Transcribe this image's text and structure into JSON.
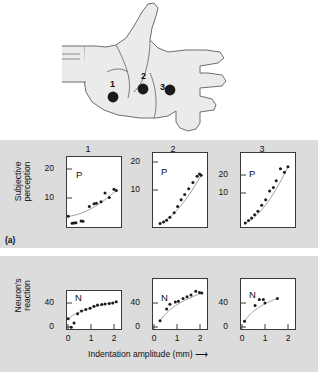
{
  "figure": {
    "panel_a_tag": "(a)",
    "x_axis_title": "Indentation amplitude (mm)",
    "x_axis_arrow": "⟶",
    "top_ylabel_line1": "Subjective",
    "top_ylabel_line2": "perception",
    "bottom_ylabel_line1": "Neuron's",
    "bottom_ylabel_line2": "reaction",
    "column_numbers": [
      "1",
      "2",
      "3"
    ],
    "hand_sites": [
      {
        "label": "1",
        "x": 37,
        "y": 31
      },
      {
        "label": "2",
        "x": 57,
        "y": 24
      },
      {
        "label": "3",
        "x": 74,
        "y": 28
      }
    ],
    "colors": {
      "panel_background": "#dcdcdc",
      "plot_background": "#ffffff",
      "axis": "#3a3a3a",
      "hand_fill": "#ebebeb",
      "hand_outline": "#6e6e6e",
      "marker": "#1a1a1a",
      "curve": "#8c8c8c",
      "text": "#111111"
    }
  },
  "chart_data": [
    {
      "type": "scatter",
      "id": "perception-site-1",
      "title": "1",
      "series_letter": "P",
      "xlabel": "Indentation amplitude (mm)",
      "ylabel": "Subjective perception",
      "xlim": [
        0,
        2.3
      ],
      "ylim": [
        0,
        26
      ],
      "xticks": [],
      "yticks": [
        10,
        20
      ],
      "grid": false,
      "legend": false,
      "points": [
        {
          "x": 0.05,
          "y": 4.0
        },
        {
          "x": 0.22,
          "y": 1.4
        },
        {
          "x": 0.3,
          "y": 1.5
        },
        {
          "x": 0.38,
          "y": 1.6
        },
        {
          "x": 0.6,
          "y": 2.2
        },
        {
          "x": 0.68,
          "y": 2.1
        },
        {
          "x": 0.95,
          "y": 7.6
        },
        {
          "x": 1.15,
          "y": 8.6
        },
        {
          "x": 1.25,
          "y": 8.8
        },
        {
          "x": 1.45,
          "y": 9.4
        },
        {
          "x": 1.62,
          "y": 12.6
        },
        {
          "x": 1.8,
          "y": 11.0
        },
        {
          "x": 2.0,
          "y": 14.0
        },
        {
          "x": 2.1,
          "y": 13.6
        }
      ],
      "fit_curve": {
        "model": "power",
        "description": "accelerating power-law fit"
      }
    },
    {
      "type": "scatter",
      "id": "perception-site-2",
      "title": "2",
      "series_letter": "P",
      "xlabel": "Indentation amplitude (mm)",
      "ylabel": "Subjective perception",
      "xlim": [
        0,
        2.3
      ],
      "ylim": [
        0,
        26
      ],
      "xticks": [],
      "yticks": [
        10,
        20
      ],
      "grid": false,
      "legend": false,
      "points": [
        {
          "x": 0.3,
          "y": 1.2
        },
        {
          "x": 0.45,
          "y": 1.8
        },
        {
          "x": 0.58,
          "y": 2.4
        },
        {
          "x": 0.72,
          "y": 3.4
        },
        {
          "x": 0.9,
          "y": 5.0
        },
        {
          "x": 1.05,
          "y": 7.2
        },
        {
          "x": 1.2,
          "y": 9.6
        },
        {
          "x": 1.35,
          "y": 11.4
        },
        {
          "x": 1.52,
          "y": 13.4
        },
        {
          "x": 1.7,
          "y": 15.6
        },
        {
          "x": 1.88,
          "y": 17.8
        },
        {
          "x": 1.98,
          "y": 18.6
        },
        {
          "x": 2.05,
          "y": 18.2
        }
      ],
      "fit_curve": {
        "model": "power",
        "description": "accelerating power-law fit"
      }
    },
    {
      "type": "scatter",
      "id": "perception-site-3",
      "title": "3",
      "series_letter": "P",
      "xlabel": "Indentation amplitude (mm)",
      "ylabel": "Subjective perception",
      "xlim": [
        0,
        2.3
      ],
      "ylim": [
        0,
        30
      ],
      "xticks": [],
      "yticks": [
        10,
        20
      ],
      "grid": false,
      "legend": false,
      "points": [
        {
          "x": 0.18,
          "y": 1.6
        },
        {
          "x": 0.32,
          "y": 2.6
        },
        {
          "x": 0.45,
          "y": 3.6
        },
        {
          "x": 0.58,
          "y": 5.0
        },
        {
          "x": 0.72,
          "y": 6.4
        },
        {
          "x": 0.88,
          "y": 8.8
        },
        {
          "x": 1.05,
          "y": 11.0
        },
        {
          "x": 1.22,
          "y": 14.6
        },
        {
          "x": 1.38,
          "y": 16.0
        },
        {
          "x": 1.5,
          "y": 18.8
        },
        {
          "x": 1.68,
          "y": 23.6
        },
        {
          "x": 1.85,
          "y": 22.2
        },
        {
          "x": 2.0,
          "y": 24.4
        }
      ],
      "fit_curve": {
        "model": "power",
        "description": "accelerating power-law fit"
      }
    },
    {
      "type": "scatter",
      "id": "neuron-site-1",
      "title": "1",
      "series_letter": "N",
      "xlabel": "Indentation amplitude (mm)",
      "ylabel": "Neuron's reaction",
      "xlim": [
        0,
        2.3
      ],
      "ylim": [
        0,
        70
      ],
      "xticks": [
        0,
        1,
        2
      ],
      "yticks": [
        0,
        40
      ],
      "grid": false,
      "legend": false,
      "points": [
        {
          "x": 0.05,
          "y": 19.0
        },
        {
          "x": 0.18,
          "y": 3.0
        },
        {
          "x": 0.3,
          "y": 11.0
        },
        {
          "x": 0.45,
          "y": 28.0
        },
        {
          "x": 0.62,
          "y": 33.0
        },
        {
          "x": 0.8,
          "y": 36.0
        },
        {
          "x": 0.98,
          "y": 38.0
        },
        {
          "x": 1.15,
          "y": 42.0
        },
        {
          "x": 1.3,
          "y": 44.0
        },
        {
          "x": 1.48,
          "y": 45.0
        },
        {
          "x": 1.62,
          "y": 46.0
        },
        {
          "x": 1.8,
          "y": 47.0
        },
        {
          "x": 1.95,
          "y": 48.0
        },
        {
          "x": 2.1,
          "y": 50.0
        }
      ],
      "fit_curve": {
        "model": "logarithmic",
        "description": "saturating logarithmic fit"
      }
    },
    {
      "type": "scatter",
      "id": "neuron-site-2",
      "title": "2",
      "series_letter": "N",
      "xlabel": "Indentation amplitude (mm)",
      "ylabel": "Neuron's reaction",
      "xlim": [
        0,
        2.3
      ],
      "ylim": [
        0,
        85
      ],
      "xticks": [
        0,
        1,
        2
      ],
      "yticks": [
        0,
        40
      ],
      "grid": false,
      "legend": false,
      "points": [
        {
          "x": 0.3,
          "y": 14.0
        },
        {
          "x": 0.58,
          "y": 34.0
        },
        {
          "x": 0.72,
          "y": 42.0
        },
        {
          "x": 0.95,
          "y": 46.0
        },
        {
          "x": 1.08,
          "y": 47.0
        },
        {
          "x": 1.28,
          "y": 52.0
        },
        {
          "x": 1.45,
          "y": 55.0
        },
        {
          "x": 1.62,
          "y": 58.0
        },
        {
          "x": 1.82,
          "y": 64.0
        },
        {
          "x": 1.98,
          "y": 62.0
        },
        {
          "x": 2.08,
          "y": 61.0
        }
      ],
      "fit_curve": {
        "model": "logarithmic",
        "description": "saturating logarithmic fit"
      }
    },
    {
      "type": "scatter",
      "id": "neuron-site-3",
      "title": "3",
      "series_letter": "N",
      "xlabel": "Indentation amplitude (mm)",
      "ylabel": "Neuron's reaction",
      "xlim": [
        0,
        2.3
      ],
      "ylim": [
        0,
        85
      ],
      "xticks": [
        0,
        1,
        2
      ],
      "yticks": [
        0,
        40
      ],
      "grid": false,
      "legend": false,
      "points": [
        {
          "x": 0.15,
          "y": 13.0
        },
        {
          "x": 0.6,
          "y": 40.0
        },
        {
          "x": 0.78,
          "y": 50.0
        },
        {
          "x": 0.95,
          "y": 50.0
        },
        {
          "x": 1.02,
          "y": 44.0
        },
        {
          "x": 1.55,
          "y": 52.0
        }
      ],
      "fit_curve": {
        "model": "logarithmic",
        "description": "saturating logarithmic fit"
      }
    }
  ]
}
